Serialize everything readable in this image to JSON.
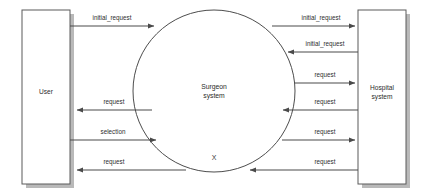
{
  "diagram": {
    "type": "data-flow-diagram",
    "background_color": "#ffffff",
    "line_color": "#4a4a4a",
    "text_color": "#2b2b2b",
    "shadow_color": "#b9b9b9",
    "external_entities": [
      {
        "id": "user",
        "label": "User",
        "shape": "rectangle",
        "position": "left"
      },
      {
        "id": "hospital_system",
        "label_line1": "Hospital",
        "label_line2": "system",
        "shape": "rectangle",
        "position": "right"
      }
    ],
    "process": {
      "id": "surgeon_system",
      "label_line1": "Surgeon",
      "label_line2": "system",
      "mark": "X",
      "shape": "circle"
    },
    "flows_left": [
      {
        "label": "initial_request",
        "direction": "user-to-process"
      },
      {
        "label": "request",
        "direction": "process-to-user"
      },
      {
        "label": "selection",
        "direction": "user-to-process"
      },
      {
        "label": "request",
        "direction": "process-to-user"
      }
    ],
    "flows_right": [
      {
        "label": "initial_request",
        "direction": "process-to-hospital"
      },
      {
        "label": "initial_request",
        "direction": "hospital-to-process"
      },
      {
        "label": "request",
        "direction": "process-to-hospital"
      },
      {
        "label": "request",
        "direction": "hospital-to-process"
      },
      {
        "label": "request",
        "direction": "process-to-hospital"
      },
      {
        "label": "request",
        "direction": "hospital-to-process"
      }
    ]
  }
}
